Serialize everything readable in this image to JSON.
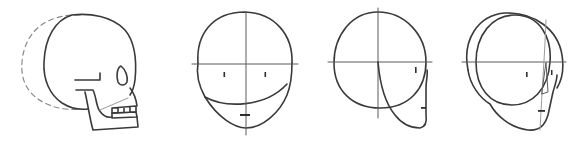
{
  "figure": {
    "panels": [
      {
        "id": "skull-side",
        "label": "Skull side view"
      },
      {
        "id": "head-front",
        "label": "Front view construction"
      },
      {
        "id": "head-side",
        "label": "Side view construction"
      },
      {
        "id": "head-three-quarter",
        "label": "Three-quarter view construction"
      }
    ],
    "colors": {
      "ink": "#3a3a3a",
      "guide": "#5a5a5a",
      "dashed": "#8a8a8a",
      "background": "#ffffff"
    }
  }
}
